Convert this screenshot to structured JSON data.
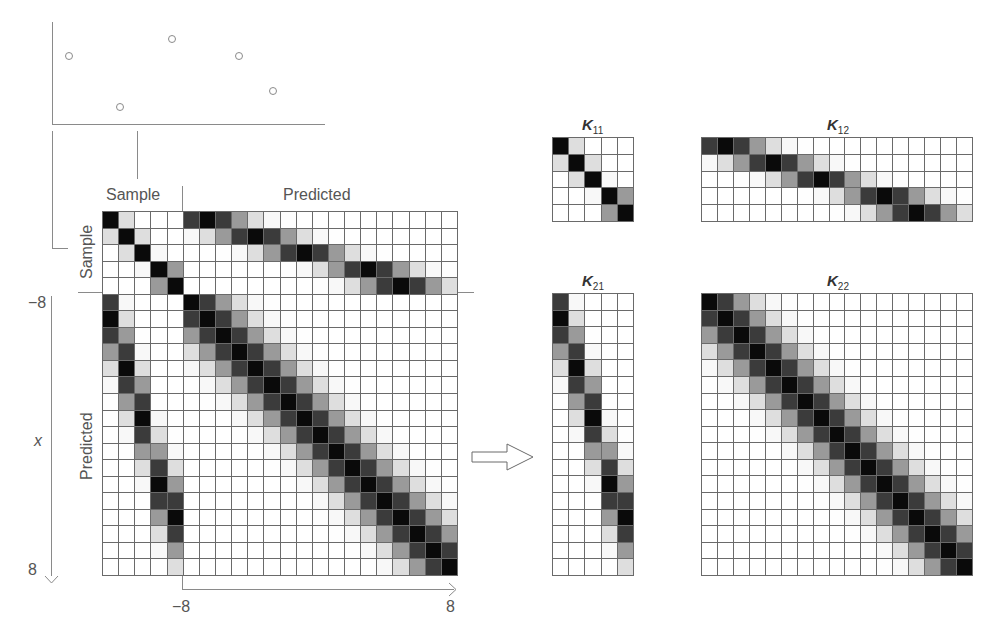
{
  "diagram": {
    "scatter": {
      "points_px": [
        [
          69,
          56
        ],
        [
          120,
          107
        ],
        [
          172,
          39
        ],
        [
          239,
          56
        ],
        [
          273,
          91
        ]
      ]
    },
    "main_matrix": {
      "col_label_sample": "Sample",
      "col_label_predicted": "Predicted",
      "row_label_sample": "Sample",
      "row_label_predicted": "Predicted"
    },
    "axes": {
      "y_axis_label": "x",
      "y_axis_min": "−8",
      "y_axis_max": "8",
      "x_axis_min": "−8",
      "x_axis_max": "8"
    },
    "kernel": {
      "type": "RBF",
      "length_scale": 1.5,
      "sample_x": [
        -7,
        -4,
        -1,
        3,
        5
      ],
      "predicted_x": [
        -8,
        -7,
        -6,
        -5,
        -4,
        -3,
        -2,
        -1,
        0,
        1,
        2,
        3,
        4,
        5,
        6,
        7,
        8
      ]
    },
    "blocks": {
      "k11": {
        "name": "K",
        "sub": "11",
        "rows": 5,
        "cols": 5
      },
      "k12": {
        "name": "K",
        "sub": "12",
        "rows": 5,
        "cols": 17
      },
      "k21": {
        "name": "K",
        "sub": "21",
        "rows": 17,
        "cols": 5
      },
      "k22": {
        "name": "K",
        "sub": "22",
        "rows": 17,
        "cols": 17
      }
    },
    "arrow": {
      "direction": "right"
    }
  }
}
